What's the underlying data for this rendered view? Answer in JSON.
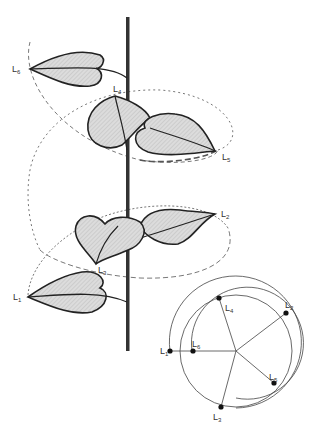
{
  "figure": {
    "stem_labels": [
      {
        "id": "L6",
        "text": "L",
        "sub": "6"
      },
      {
        "id": "L4",
        "text": "L",
        "sub": "4"
      },
      {
        "id": "L5",
        "text": "L",
        "sub": "5"
      },
      {
        "id": "L2",
        "text": "L",
        "sub": "2"
      },
      {
        "id": "L3",
        "text": "L",
        "sub": "3"
      },
      {
        "id": "L1",
        "text": "L",
        "sub": "1"
      }
    ],
    "diagram_labels": [
      {
        "id": "L4",
        "text": "L",
        "sub": "4"
      },
      {
        "id": "L2",
        "text": "L",
        "sub": "2"
      },
      {
        "id": "L6",
        "text": "L",
        "sub": "6"
      },
      {
        "id": "L1",
        "text": "L",
        "sub": "1"
      },
      {
        "id": "L5",
        "text": "L",
        "sub": "5"
      },
      {
        "id": "L3",
        "text": "L",
        "sub": "3"
      }
    ]
  },
  "colors": {
    "ink": "#222222",
    "leaf_fill": "#d4d4d4",
    "guide": "#555555"
  }
}
